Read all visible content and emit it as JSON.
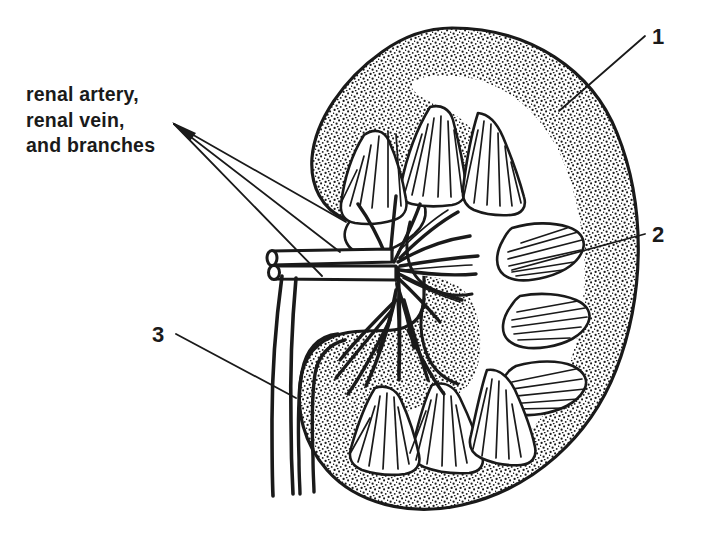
{
  "figure": {
    "ink_color": "#1a1a1a",
    "background_color": "#ffffff"
  },
  "labels": {
    "vessels": {
      "line1": "renal artery,",
      "line2": "renal vein,",
      "line3": "and branches"
    },
    "numbers": [
      {
        "id": "1",
        "text": "1"
      },
      {
        "id": "2",
        "text": "2"
      },
      {
        "id": "3",
        "text": "3"
      }
    ]
  }
}
